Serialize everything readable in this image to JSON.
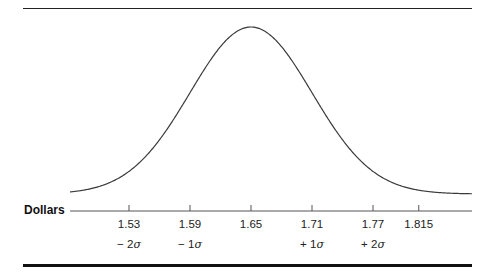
{
  "chart_data": {
    "type": "line",
    "title": "",
    "xlabel": "Dollars",
    "ylabel": "",
    "mean": 1.65,
    "std_dev": 0.06,
    "xlim": [
      1.45,
      1.88
    ],
    "grid": false,
    "legend": null,
    "ticks": [
      {
        "value": 1.53,
        "label": "1.53",
        "sigma_label": "− 2",
        "px": 129
      },
      {
        "value": 1.59,
        "label": "1.59",
        "sigma_label": "− 1",
        "px": 190
      },
      {
        "value": 1.65,
        "label": "1.65",
        "sigma_label": "",
        "px": 251
      },
      {
        "value": 1.71,
        "label": "1.71",
        "sigma_label": "+ 1",
        "px": 312
      },
      {
        "value": 1.77,
        "label": "1.77",
        "sigma_label": "+ 2",
        "px": 373
      },
      {
        "value": 1.815,
        "label": "1.815",
        "sigma_label": "",
        "px": 408
      }
    ],
    "sigma_symbol": "σ"
  },
  "axis": {
    "label": "Dollars"
  },
  "colors": {
    "curve": "#3a3a3a",
    "axis": "#555555",
    "rules": "#111111"
  }
}
